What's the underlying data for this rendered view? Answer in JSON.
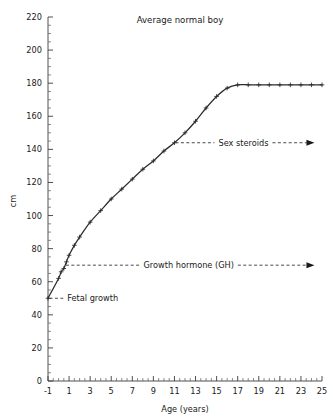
{
  "chart_data": {
    "type": "line",
    "title": "Average normal boy",
    "xlabel": "Age (years)",
    "ylabel": "cm",
    "xlim": [
      -1,
      25
    ],
    "ylim": [
      0,
      220
    ],
    "grid": false,
    "legend_position": "none",
    "x_tick_labels": [
      "-1",
      "1",
      "3",
      "5",
      "7",
      "9",
      "11",
      "13",
      "15",
      "17",
      "19",
      "21",
      "23",
      "25"
    ],
    "x_tick_values": [
      -1,
      1,
      3,
      5,
      7,
      9,
      11,
      13,
      15,
      17,
      19,
      21,
      23,
      25
    ],
    "x_minor_step": 0.5,
    "y_tick_labels": [
      "0",
      "20",
      "40",
      "60",
      "80",
      "100",
      "120",
      "140",
      "160",
      "180",
      "200",
      "220"
    ],
    "y_tick_values": [
      0,
      20,
      40,
      60,
      80,
      100,
      120,
      140,
      160,
      180,
      200,
      220
    ],
    "y_minor_step": 5,
    "series": [
      {
        "name": "Average normal boy height",
        "marker": "plus",
        "color": "#2b2b2b",
        "x": [
          -1,
          0,
          0.25,
          0.5,
          0.75,
          1,
          1.5,
          2,
          3,
          4,
          5,
          6,
          7,
          8,
          9,
          10,
          11,
          12,
          13,
          14,
          15,
          16,
          17,
          18,
          19,
          20,
          21,
          22,
          23,
          24,
          25
        ],
        "y": [
          50,
          62,
          66,
          68,
          72,
          76,
          82,
          87,
          96,
          103,
          110,
          116,
          122,
          128,
          133,
          139,
          144,
          150,
          157,
          165,
          172,
          177,
          179,
          179,
          179,
          179,
          179,
          179,
          179,
          179,
          179
        ]
      }
    ],
    "annotations": [
      {
        "id": "fetal-growth",
        "label": "Fetal growth",
        "from_x": -0.85,
        "from_y": 50,
        "to_x": 0.45,
        "to_y": 50,
        "arrow": false,
        "label_align": "start"
      },
      {
        "id": "growth-hormone",
        "label": "Growth hormone (GH)",
        "from_x": 0.7,
        "from_y": 70,
        "to_x": 24.0,
        "to_y": 70,
        "arrow": true,
        "label_align": "middle"
      },
      {
        "id": "sex-steroids",
        "label": "Sex steroids",
        "from_x": 11.1,
        "from_y": 144,
        "to_x": 24.0,
        "to_y": 144,
        "arrow": true,
        "label_align": "middle"
      }
    ]
  }
}
